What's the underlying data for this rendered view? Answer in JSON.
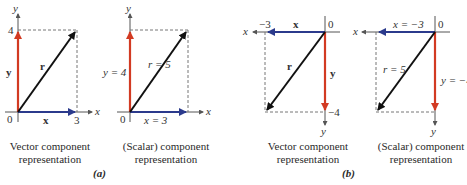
{
  "colors": {
    "x_component": "#2b3a8c",
    "y_component": "#d23a22",
    "resultant": "#111111",
    "axis": "#555555",
    "dashed": "#777777"
  },
  "panels": [
    {
      "id": "a1",
      "axis_x": "x",
      "axis_y": "y",
      "origin": "0",
      "x_tick": "3",
      "y_tick": "4",
      "x_label": "x⃗",
      "y_label": "y⃗",
      "r_label": "r⃗",
      "caption": [
        "Vector component",
        "representation"
      ]
    },
    {
      "id": "a2",
      "axis_x": "x",
      "axis_y": "y",
      "origin": "0",
      "x_label": "x = 3",
      "y_label": "y = 4",
      "r_label": "r = 5",
      "caption": [
        "(Scalar) component",
        "representation"
      ]
    },
    {
      "id": "b1",
      "axis_x": "x",
      "axis_y": "y",
      "origin": "0",
      "x_tick": "−3",
      "y_tick": "−4",
      "x_label": "x⃗",
      "y_label": "y⃗",
      "r_label": "r⃗",
      "caption": [
        "Vector component",
        "representation"
      ]
    },
    {
      "id": "b2",
      "axis_x": "x",
      "axis_y": "y",
      "origin": "0",
      "x_label": "x = −3",
      "y_label": "y = −4",
      "r_label": "r = 5",
      "caption": [
        "(Scalar) component",
        "representation"
      ]
    }
  ],
  "part_labels": {
    "a": "(a)",
    "b": "(b)"
  }
}
